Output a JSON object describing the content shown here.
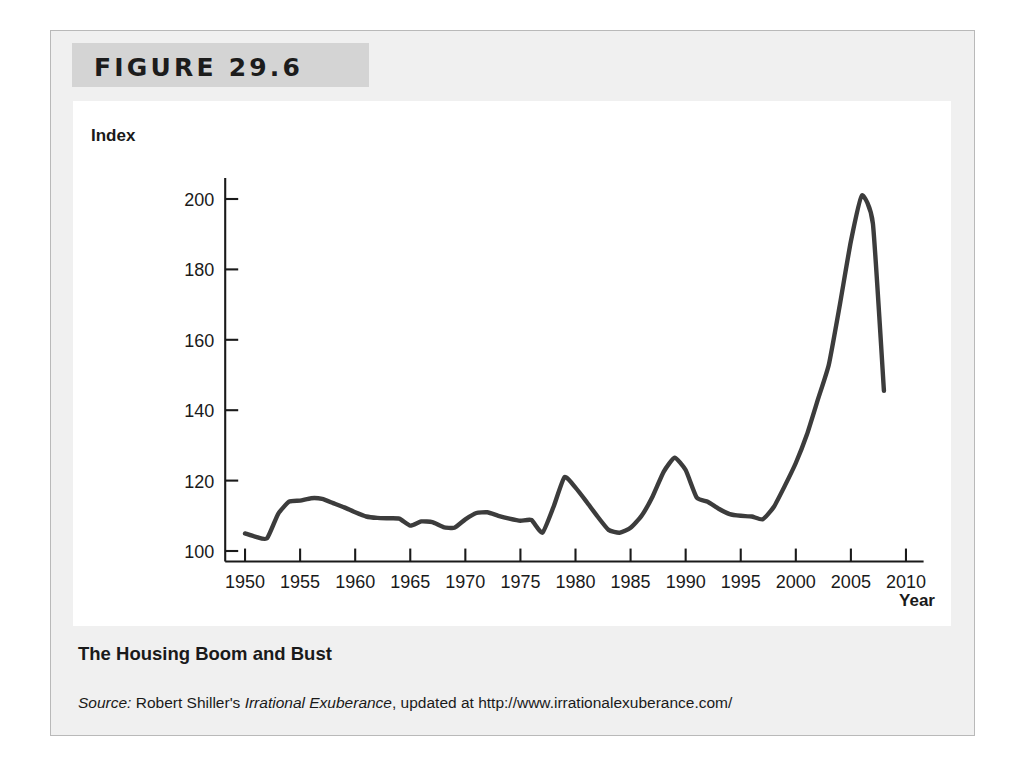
{
  "figure": {
    "number_label": "FIGURE 29.6",
    "caption_title": "The Housing Boom and Bust",
    "source": {
      "prefix": "Source:",
      "author": " Robert Shiller's ",
      "book": "Irrational Exuberance",
      "suffix": ", updated at http://www.irrationalexuberance.com/"
    }
  },
  "chart_data": {
    "type": "line",
    "title": "The Housing Boom and Bust",
    "xlabel": "Year",
    "ylabel": "Index",
    "xlim": [
      1948,
      2012
    ],
    "ylim": [
      96,
      208
    ],
    "grid": false,
    "legend": null,
    "line_color": "#3c3c3c",
    "axis_color": "#1a1a1a",
    "xticks": [
      1950,
      1955,
      1960,
      1965,
      1970,
      1975,
      1980,
      1985,
      1990,
      1995,
      2000,
      2005,
      2010
    ],
    "xtick_labels": [
      "1950",
      "1955",
      "1960",
      "1965",
      "1970",
      "1975",
      "1980",
      "1985",
      "1990",
      "1995",
      "2000",
      "2005",
      "2010"
    ],
    "yticks": [
      100,
      120,
      140,
      160,
      180,
      200
    ],
    "ytick_labels": [
      "100",
      "120",
      "140",
      "160",
      "180",
      "200"
    ],
    "series": [
      {
        "name": "Real home price index",
        "x": [
          1950,
          1951,
          1952,
          1953,
          1954,
          1955,
          1956,
          1957,
          1958,
          1959,
          1960,
          1961,
          1962,
          1963,
          1964,
          1965,
          1966,
          1967,
          1968,
          1969,
          1970,
          1971,
          1972,
          1973,
          1974,
          1975,
          1976,
          1977,
          1978,
          1979,
          1980,
          1981,
          1982,
          1983,
          1984,
          1985,
          1986,
          1987,
          1988,
          1989,
          1990,
          1991,
          1992,
          1993,
          1994,
          1995,
          1996,
          1997,
          1998,
          1999,
          2000,
          2001,
          2002,
          2003,
          2004,
          2005,
          2006,
          2007,
          2008
        ],
        "y": [
          105.0,
          104.0,
          103.6,
          110.5,
          114.0,
          114.3,
          115.0,
          114.8,
          113.6,
          112.4,
          111.0,
          109.8,
          109.4,
          109.3,
          109.2,
          107.2,
          108.4,
          108.2,
          106.8,
          106.6,
          109.0,
          110.8,
          111.0,
          110.0,
          109.2,
          108.6,
          108.8,
          105.2,
          112.5,
          121.0,
          118.0,
          114.0,
          109.8,
          106.0,
          105.2,
          106.6,
          110.0,
          115.5,
          122.5,
          126.5,
          123.0,
          115.2,
          114.0,
          112.0,
          110.5,
          110.0,
          109.8,
          109.0,
          112.5,
          118.5,
          125.0,
          133.0,
          143.0,
          153.0,
          170.0,
          188.0,
          201.0,
          193.0,
          145.5
        ]
      }
    ]
  }
}
